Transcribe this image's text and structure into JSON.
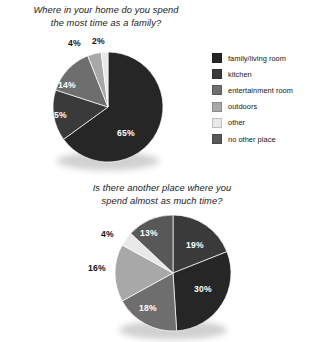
{
  "background": "#ffffff",
  "palette": {
    "family_living_room": "#262626",
    "kitchen": "#3a3a3a",
    "entertainment_room": "#6e6e6e",
    "outdoors": "#a8a8a8",
    "other": "#e8e8e8",
    "no_other_place": "#585858",
    "label_inside": "#ffffff",
    "label_outside": "#141414"
  },
  "legend": {
    "items": [
      {
        "label": "family/living room",
        "color": "#262626"
      },
      {
        "label": "kitchen",
        "color": "#3a3a3a"
      },
      {
        "label": "entertainment room",
        "color": "#6e6e6e"
      },
      {
        "label": "outdoors",
        "color": "#a8a8a8"
      },
      {
        "label": "other",
        "color": "#e8e8e8"
      },
      {
        "label": "no other place",
        "color": "#585858"
      }
    ]
  },
  "chart_data": [
    {
      "type": "pie",
      "title": "Where in your home do you spend the most time as a family?",
      "title_lines": [
        "Where in your home do you spend",
        "the most time as a family?"
      ],
      "categories": [
        "family/living room",
        "kitchen",
        "entertainment room",
        "outdoors",
        "other"
      ],
      "values": [
        65,
        15,
        14,
        4,
        2
      ],
      "value_labels": [
        "65%",
        "15%",
        "14%",
        "4%",
        "2%"
      ],
      "colors": [
        "#262626",
        "#3a3a3a",
        "#6e6e6e",
        "#a8a8a8",
        "#e8e8e8"
      ],
      "label_placement": [
        "inside",
        "inside",
        "inside",
        "outside",
        "outside"
      ],
      "units": "percent",
      "start_angle_deg": 0,
      "direction": "clockwise",
      "legend_position": "right",
      "grid": false
    },
    {
      "type": "pie",
      "title": "Is there another place where you spend almost as much time?",
      "title_lines": [
        "Is there another place where you",
        "spend almost as much time?"
      ],
      "categories": [
        "kitchen",
        "family/living room",
        "entertainment room",
        "outdoors",
        "other",
        "no other place"
      ],
      "values": [
        19,
        30,
        18,
        16,
        4,
        13
      ],
      "value_labels": [
        "19%",
        "30%",
        "18%",
        "16%",
        "4%",
        "13%"
      ],
      "colors": [
        "#3a3a3a",
        "#262626",
        "#6e6e6e",
        "#a8a8a8",
        "#e8e8e8",
        "#585858"
      ],
      "label_placement": [
        "inside",
        "inside",
        "inside",
        "outside",
        "outside",
        "inside"
      ],
      "units": "percent",
      "start_angle_deg": 0,
      "direction": "clockwise",
      "legend_position": "shared-above",
      "grid": false
    }
  ]
}
